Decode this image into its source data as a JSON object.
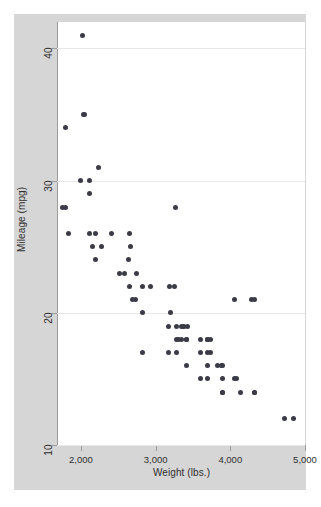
{
  "figure": {
    "background_color": "#ffffff",
    "graph_region_color": "#d6d6d6",
    "plot_region_color": "#ffffff",
    "marker_color": "#3b3b47",
    "gridline_color": "#e8e8e8",
    "axis_color": "#9b9b9b"
  },
  "axes": {
    "y_title": "Mileage (mpg)",
    "x_title": "Weight (lbs.)",
    "y_ticks": [
      "10",
      "20",
      "30",
      "40"
    ],
    "x_ticks": [
      "2,000",
      "3,000",
      "4,000",
      "5,000"
    ]
  },
  "chart_data": {
    "type": "scatter",
    "title": "",
    "xlabel": "Weight (lbs.)",
    "ylabel": "Mileage (mpg)",
    "xlim": [
      1680,
      5000
    ],
    "ylim": [
      10,
      42
    ],
    "xticks": [
      2000,
      3000,
      4000,
      5000
    ],
    "xticklabels": [
      "2,000",
      "3,000",
      "4,000",
      "5,000"
    ],
    "yticks": [
      10,
      20,
      30,
      40
    ],
    "yticklabels": [
      "10",
      "20",
      "30",
      "40"
    ],
    "grid": "horizontal",
    "legend": "none",
    "marker": "filled-circle",
    "n_points": 74,
    "x": [
      2020,
      2050,
      2040,
      1800,
      2230,
      1990,
      2110,
      2110,
      1760,
      1800,
      1830,
      2200,
      2120,
      2160,
      2410,
      2280,
      2190,
      2650,
      2670,
      2640,
      2520,
      2580,
      2750,
      2830,
      2650,
      2690,
      2730,
      2830,
      2930,
      3180,
      3250,
      3260,
      3200,
      3170,
      3280,
      3350,
      3370,
      3380,
      3430,
      3280,
      3300,
      3350,
      3420,
      3420,
      3600,
      3690,
      3700,
      3730,
      3690,
      3600,
      3740,
      3830,
      3880,
      3900,
      3900,
      4060,
      4080,
      4130,
      4290,
      4330,
      4330,
      2830,
      3170,
      3280,
      3420,
      3600,
      3690,
      3700,
      3890,
      3900,
      4060,
      4330,
      4720,
      4840
    ],
    "y": [
      41,
      35,
      35,
      34,
      31,
      30,
      30,
      29,
      28,
      28,
      26,
      26,
      26,
      25,
      26,
      25,
      24,
      26,
      25,
      24,
      23,
      23,
      23,
      22,
      22,
      21,
      21,
      20,
      22,
      22,
      22,
      28,
      20,
      19,
      19,
      19,
      19,
      19,
      19,
      18,
      18,
      18,
      18,
      18,
      18,
      18,
      18,
      18,
      17,
      17,
      17,
      16,
      16,
      16,
      15,
      15,
      15,
      14,
      21,
      21,
      14,
      17,
      17,
      17,
      16,
      15,
      16,
      15,
      14,
      14,
      21,
      14,
      12,
      12
    ],
    "relationship": "negative, nonlinear (heavier cars get lower mileage)"
  }
}
